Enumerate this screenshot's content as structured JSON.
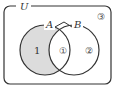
{
  "diagram": {
    "type": "venn",
    "universe_label": "U",
    "sets": [
      {
        "label": "A"
      },
      {
        "label": "B"
      }
    ],
    "regions": {
      "a_only": "1",
      "intersection": "①",
      "b_only": "②",
      "outside": "③"
    },
    "shaded_region": "A only (A minus B)",
    "colors": {
      "stroke": "#333333",
      "shade": "#dcdcdc",
      "background": "#ffffff"
    }
  }
}
